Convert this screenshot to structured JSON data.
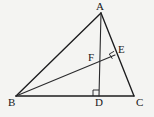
{
  "figure": {
    "type": "geometry-diagram",
    "background_color": "#f4f4f2",
    "stroke_color": "#1c1c1e",
    "label_color": "#18181a",
    "canvas": {
      "width": 154,
      "height": 117
    },
    "points": [
      {
        "id": "A",
        "label": "A",
        "x": 101,
        "y": 13,
        "label_x": 96,
        "label_y": 1
      },
      {
        "id": "B",
        "label": "B",
        "x": 16,
        "y": 96,
        "label_x": 8,
        "label_y": 97
      },
      {
        "id": "C",
        "label": "C",
        "x": 134,
        "y": 96,
        "label_x": 136,
        "label_y": 97
      },
      {
        "id": "D",
        "label": "D",
        "x": 99,
        "y": 96,
        "label_x": 95,
        "label_y": 97
      },
      {
        "id": "E",
        "label": "E",
        "x": 115,
        "y": 55,
        "label_x": 118,
        "label_y": 44
      },
      {
        "id": "F",
        "label": "F",
        "x": 100,
        "y": 62,
        "label_x": 88,
        "label_y": 52
      }
    ],
    "segments": [
      {
        "id": "AB",
        "from": "A",
        "to": "B",
        "x1": 101,
        "y1": 13,
        "x2": 16,
        "y2": 96
      },
      {
        "id": "AC",
        "from": "A",
        "to": "C",
        "x1": 101,
        "y1": 13,
        "x2": 134,
        "y2": 96
      },
      {
        "id": "BC",
        "from": "B",
        "to": "C",
        "x1": 16,
        "y1": 96,
        "x2": 134,
        "y2": 96
      },
      {
        "id": "AD",
        "from": "A",
        "to": "D",
        "x1": 101,
        "y1": 13,
        "x2": 99,
        "y2": 96
      },
      {
        "id": "BE",
        "from": "B",
        "to": "E",
        "x1": 16,
        "y1": 96,
        "x2": 115,
        "y2": 55
      }
    ],
    "right_angles": [
      {
        "id": "right-angle-at-D",
        "at": "D",
        "points": "93,96 93,90 99,90 99,96"
      },
      {
        "id": "right-angle-at-E",
        "at": "E",
        "points": "112.2,58.5 109.5,54.2 113.8,51.5"
      }
    ]
  }
}
